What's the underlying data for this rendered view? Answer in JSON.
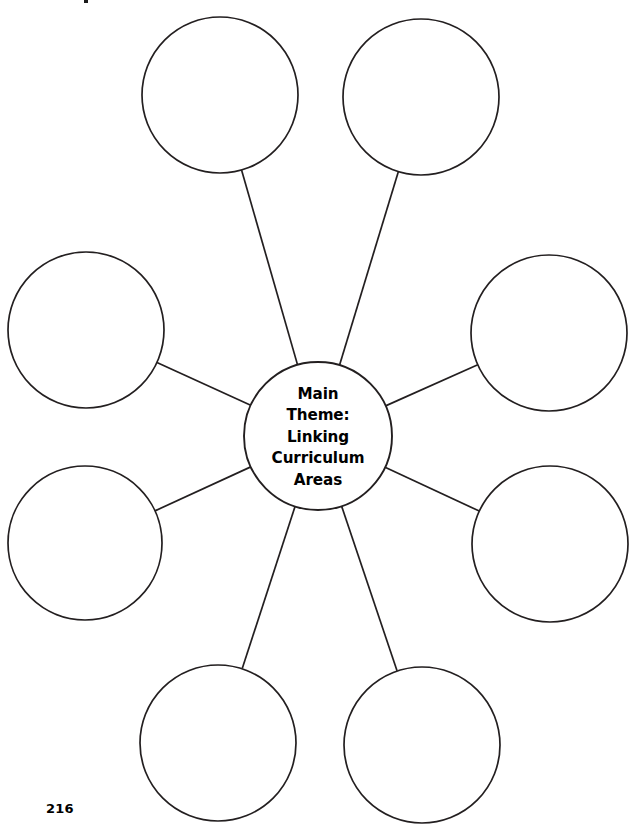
{
  "page": {
    "page_number": "216",
    "background_color": "#ffffff",
    "stroke_color": "#231f20",
    "width": 640,
    "height": 837
  },
  "diagram": {
    "type": "spider-web-graphic-organizer",
    "center": {
      "label_lines": [
        "Main",
        "Theme:",
        "Linking",
        "Curriculum",
        "Areas"
      ],
      "label_full": "Main Theme: Linking Curriculum Areas",
      "cx": 318,
      "cy": 436,
      "r": 74
    },
    "outer_nodes": [
      {
        "name": "top-left",
        "label": "",
        "cx": 220,
        "cy": 95,
        "r": 78
      },
      {
        "name": "top-right",
        "label": "",
        "cx": 421,
        "cy": 97,
        "r": 78
      },
      {
        "name": "left-upper",
        "label": "",
        "cx": 86,
        "cy": 330,
        "r": 78
      },
      {
        "name": "right-upper",
        "label": "",
        "cx": 549,
        "cy": 333,
        "r": 78
      },
      {
        "name": "left-lower",
        "label": "",
        "cx": 85,
        "cy": 543,
        "r": 77
      },
      {
        "name": "right-lower",
        "label": "",
        "cx": 550,
        "cy": 544,
        "r": 78
      },
      {
        "name": "bottom-left",
        "label": "",
        "cx": 218,
        "cy": 743,
        "r": 78
      },
      {
        "name": "bottom-right",
        "label": "",
        "cx": 422,
        "cy": 745,
        "r": 78
      }
    ]
  }
}
